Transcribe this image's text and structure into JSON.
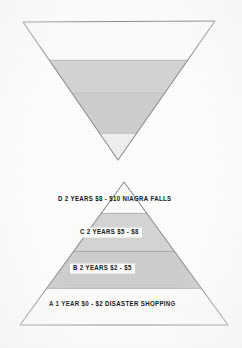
{
  "page": {
    "background_color": "#fdfdfc",
    "ink_color": "#15161a",
    "stroke_color": "#8d8f93"
  },
  "figures": {
    "funnel": {
      "name": "inverted-triangle-funnel",
      "shape": "inverted-triangle",
      "fill_top": "#fcfcfb",
      "fill_mid": "#d2d3d2",
      "fill_low": "#cfd0cf",
      "fill_tip": "#eeefee",
      "bands": [
        {
          "id": "funnel-band-1",
          "fill": "#fcfcfb"
        },
        {
          "id": "funnel-band-2",
          "fill": "#d3d4d3"
        },
        {
          "id": "funnel-band-3",
          "fill": "#cdcecd"
        },
        {
          "id": "funnel-band-4",
          "fill": "#eef0ee"
        }
      ]
    },
    "pyramid": {
      "name": "labeled-pyramid",
      "shape": "triangle",
      "tiers": [
        {
          "id": "tier-d",
          "letter": "D",
          "duration": "2 YEARS",
          "price": "$8 - $10",
          "description": "NIAGRA FALLS",
          "label": "D   2 YEARS   $8 - $10   NIAGRA FALLS",
          "fill": "#fcfcfb"
        },
        {
          "id": "tier-c",
          "letter": "C",
          "duration": "2 YEARS",
          "price": "$5 - $8",
          "description": "",
          "label": "C   2 YEARS   $5 - $8",
          "fill": "#d4d5d4"
        },
        {
          "id": "tier-b",
          "letter": "B",
          "duration": "2 YEARS",
          "price": "$2 - $5",
          "description": "",
          "label": "B   2 YEARS   $2 - $5",
          "fill": "#cdcecd"
        },
        {
          "id": "tier-a",
          "letter": "A",
          "duration": "1 YEAR",
          "price": "$0 - $2",
          "description": "DISASTER SHOPPING",
          "label": "A   1 YEAR   $0 - $2   DISASTER SHOPPING",
          "fill": "#fcfcfb"
        }
      ]
    }
  }
}
